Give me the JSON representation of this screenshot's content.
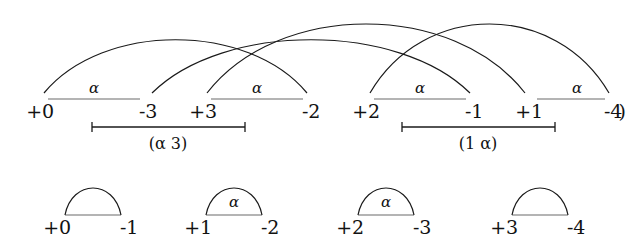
{
  "figure": {
    "stroke_color": "#1a1a1a",
    "baseline_color": "#6a6a6a",
    "background": "#ffffff"
  },
  "top_row": {
    "baseline_y": 99,
    "pairs": [
      {
        "left_label": "+0",
        "right_label": "-3",
        "left_x": 40,
        "right_x": 148,
        "alpha": "α",
        "alpha_x": 94
      },
      {
        "left_label": "+3",
        "right_label": "-2",
        "left_x": 203,
        "right_x": 311,
        "alpha": "α",
        "alpha_x": 257
      },
      {
        "left_label": "+2",
        "right_label": "-1",
        "left_x": 366,
        "right_x": 474,
        "alpha": "α",
        "alpha_x": 420
      },
      {
        "left_label": "+1",
        "right_label": "-4",
        "left_x": 529,
        "right_x": 613,
        "alpha": "α",
        "alpha_x": 577
      }
    ],
    "trailing_paren": ")",
    "trailing_paren_x": 622
  },
  "top_arcs": [
    {
      "name": "arc-0-to-2",
      "from_x": 40,
      "to_x": 311,
      "height": 63
    },
    {
      "name": "arc-3-to-3",
      "from_x": 148,
      "to_x": 474,
      "height": 63
    },
    {
      "name": "arc-2-to-1",
      "from_x": 203,
      "to_x": 529,
      "height": 84
    },
    {
      "name": "arc-1-to-4",
      "from_x": 366,
      "to_x": 613,
      "height": 84
    }
  ],
  "brackets": [
    {
      "label": "(α 3)",
      "x1": 92,
      "x2": 245,
      "y": 127,
      "label_x": 168,
      "label_y": 134
    },
    {
      "label": "(1 α)",
      "x1": 402,
      "x2": 555,
      "y": 127,
      "label_x": 478,
      "label_y": 134
    }
  ],
  "bottom_row": {
    "baseline_y": 215,
    "pairs": [
      {
        "left_label": "+0",
        "right_label": "-1",
        "left_x": 57,
        "right_x": 129,
        "alpha": "",
        "alpha_x": 93
      },
      {
        "left_label": "+1",
        "right_label": "-2",
        "left_x": 198,
        "right_x": 270,
        "alpha": "α",
        "alpha_x": 234
      },
      {
        "left_label": "+2",
        "right_label": "-3",
        "left_x": 350,
        "right_x": 422,
        "alpha": "α",
        "alpha_x": 386
      },
      {
        "left_label": "+3",
        "right_label": "-4",
        "left_x": 504,
        "right_x": 576,
        "alpha": "",
        "alpha_x": 540
      }
    ]
  }
}
